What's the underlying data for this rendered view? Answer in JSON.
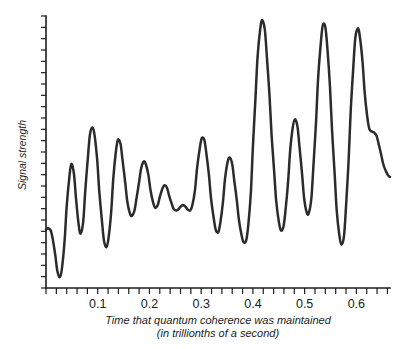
{
  "chart_data": {
    "type": "line",
    "title": "",
    "xlabel": "Time that quantum coherence was maintained",
    "xlabel_line2": "(in trillionths of a second)",
    "ylabel": "Signal strength",
    "xlim": [
      0,
      0.665
    ],
    "ylim": [
      0,
      1
    ],
    "grid": false,
    "legend": "none",
    "line_color": "#2b2b2b",
    "axis_color": "#1c1c1c",
    "background": "#ffffff",
    "x_tick_labels": [
      "0.1",
      "0.2",
      "0.3",
      "0.4",
      "0.5",
      "0.6"
    ],
    "x_tick_label_values": [
      0.1,
      0.2,
      0.3,
      0.4,
      0.5,
      0.6
    ],
    "x_minor_tick_step": 0.02,
    "y_tick_count": 25,
    "y_tick_labels": [],
    "series": [
      {
        "name": "signal",
        "x": [
          0.0,
          0.004,
          0.009,
          0.013,
          0.018,
          0.022,
          0.027,
          0.031,
          0.036,
          0.04,
          0.045,
          0.049,
          0.054,
          0.058,
          0.063,
          0.067,
          0.072,
          0.076,
          0.081,
          0.085,
          0.09,
          0.094,
          0.099,
          0.103,
          0.108,
          0.112,
          0.117,
          0.121,
          0.126,
          0.13,
          0.135,
          0.139,
          0.144,
          0.148,
          0.153,
          0.157,
          0.162,
          0.166,
          0.171,
          0.175,
          0.18,
          0.184,
          0.189,
          0.193,
          0.198,
          0.202,
          0.207,
          0.211,
          0.216,
          0.22,
          0.225,
          0.229,
          0.234,
          0.238,
          0.243,
          0.247,
          0.252,
          0.256,
          0.261,
          0.265,
          0.27,
          0.274,
          0.279,
          0.283,
          0.288,
          0.292,
          0.297,
          0.301,
          0.306,
          0.31,
          0.315,
          0.319,
          0.324,
          0.328,
          0.333,
          0.337,
          0.342,
          0.346,
          0.351,
          0.355,
          0.36,
          0.364,
          0.369,
          0.373,
          0.378,
          0.382,
          0.387,
          0.391,
          0.396,
          0.4,
          0.405,
          0.409,
          0.414,
          0.418,
          0.423,
          0.427,
          0.432,
          0.436,
          0.441,
          0.445,
          0.45,
          0.454,
          0.459,
          0.463,
          0.468,
          0.472,
          0.477,
          0.481,
          0.486,
          0.49,
          0.495,
          0.499,
          0.504,
          0.508,
          0.513,
          0.517,
          0.522,
          0.526,
          0.531,
          0.535,
          0.54,
          0.544,
          0.549,
          0.553,
          0.558,
          0.562,
          0.567,
          0.571,
          0.576,
          0.58,
          0.585,
          0.589,
          0.594,
          0.598,
          0.603,
          0.607,
          0.612,
          0.616,
          0.621,
          0.625,
          0.63,
          0.634,
          0.639,
          0.643,
          0.648,
          0.652,
          0.657,
          0.661,
          0.665
        ],
        "y": [
          0.215,
          0.22,
          0.212,
          0.18,
          0.12,
          0.062,
          0.04,
          0.075,
          0.175,
          0.3,
          0.405,
          0.456,
          0.42,
          0.33,
          0.235,
          0.2,
          0.245,
          0.36,
          0.48,
          0.565,
          0.59,
          0.56,
          0.47,
          0.355,
          0.25,
          0.175,
          0.15,
          0.185,
          0.28,
          0.4,
          0.5,
          0.545,
          0.53,
          0.47,
          0.39,
          0.32,
          0.275,
          0.265,
          0.285,
          0.33,
          0.39,
          0.44,
          0.465,
          0.455,
          0.415,
          0.36,
          0.315,
          0.295,
          0.305,
          0.335,
          0.365,
          0.378,
          0.368,
          0.34,
          0.31,
          0.29,
          0.285,
          0.29,
          0.3,
          0.305,
          0.298,
          0.288,
          0.285,
          0.305,
          0.36,
          0.44,
          0.51,
          0.55,
          0.545,
          0.495,
          0.415,
          0.33,
          0.26,
          0.215,
          0.205,
          0.24,
          0.315,
          0.4,
          0.462,
          0.48,
          0.455,
          0.395,
          0.32,
          0.25,
          0.195,
          0.168,
          0.175,
          0.23,
          0.35,
          0.52,
          0.7,
          0.85,
          0.95,
          0.985,
          0.95,
          0.85,
          0.71,
          0.565,
          0.43,
          0.32,
          0.245,
          0.212,
          0.225,
          0.285,
          0.39,
          0.505,
          0.59,
          0.62,
          0.595,
          0.52,
          0.42,
          0.33,
          0.278,
          0.275,
          0.33,
          0.45,
          0.61,
          0.77,
          0.895,
          0.965,
          0.96,
          0.88,
          0.74,
          0.58,
          0.42,
          0.285,
          0.195,
          0.16,
          0.19,
          0.3,
          0.47,
          0.65,
          0.81,
          0.92,
          0.955,
          0.92,
          0.83,
          0.72,
          0.63,
          0.585,
          0.575,
          0.572,
          0.56,
          0.53,
          0.49,
          0.455,
          0.43,
          0.415,
          0.408
        ]
      }
    ]
  }
}
